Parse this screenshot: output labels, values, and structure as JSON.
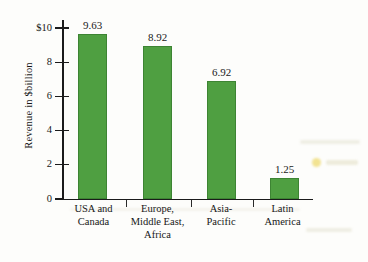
{
  "chart_data": {
    "type": "bar",
    "title": "",
    "subtitle": "",
    "xlabel": "",
    "ylabel": "Revenue in $billion",
    "ylim": [
      0,
      10
    ],
    "grid": false,
    "legend": "none",
    "bar_color": "#4f9f41",
    "categories": [
      "USA and Canada",
      "Europe, Middle East, Africa",
      "Asia-Pacific",
      "Latin America"
    ],
    "category_lines": [
      [
        "USA and",
        "Canada"
      ],
      [
        "Europe,",
        "Middle East,",
        "Africa"
      ],
      [
        "Asia-",
        "Pacific"
      ],
      [
        "Latin",
        "America"
      ]
    ],
    "values": [
      9.63,
      8.92,
      6.92,
      1.25
    ],
    "value_labels": [
      "9.63",
      "8.92",
      "6.92",
      "1.25"
    ],
    "ytick_values": [
      0,
      2,
      4,
      6,
      8,
      10
    ],
    "ytick_labels": [
      "0",
      "2",
      "4",
      "6",
      "8",
      "$10"
    ]
  }
}
